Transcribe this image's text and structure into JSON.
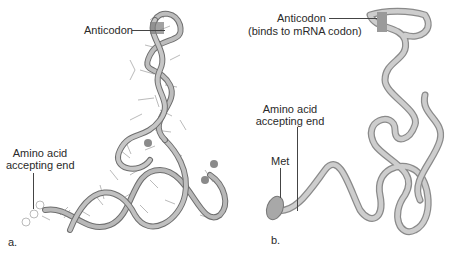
{
  "figure": {
    "panel_a": {
      "letter": "a.",
      "labels": {
        "anticodon": "Anticodon",
        "amino_line1": "Amino acid",
        "amino_line2": "accepting end"
      }
    },
    "panel_b": {
      "letter": "b.",
      "labels": {
        "anticodon": "Anticodon",
        "anticodon_note": "(binds to mRNA codon)",
        "amino_line1": "Amino acid",
        "amino_line2": "accepting end",
        "met": "Met"
      }
    },
    "colors": {
      "ribbon": "#a8a8a8",
      "ribbon_dark": "#6e6e6e",
      "tube": "#c4c4c4",
      "tube_edge": "#8a8a8a",
      "text": "#2a2a2a"
    }
  }
}
